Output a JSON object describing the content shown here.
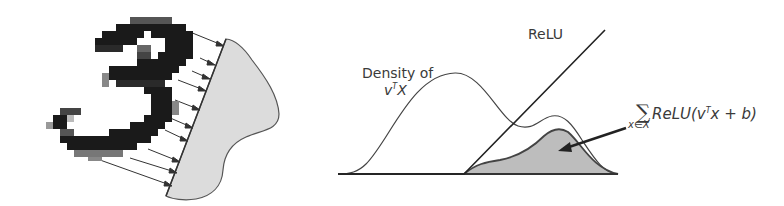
{
  "figure": {
    "left_panel": {
      "description": "Pixelated handwritten digit projected onto a direction",
      "digit": "3",
      "icons": [
        "digit-image",
        "projection-arrows",
        "density-blob"
      ]
    },
    "right_panel": {
      "density_label_line1": "Density of",
      "density_label_var": "v",
      "density_label_sup": "T",
      "density_label_tail": "X",
      "relu_label": "ReLU",
      "sum_symbol": "∑",
      "sum_subscript": "x∈X",
      "sum_expr_pre": "ReLU(v",
      "sum_expr_sup": "T",
      "sum_expr_post": "x + b)"
    },
    "colors": {
      "ink": "#333333",
      "digit_dark": "#1a1a1a",
      "fill_gray": "#bdbdbd",
      "blob_gray": "#dcdcdc"
    }
  }
}
